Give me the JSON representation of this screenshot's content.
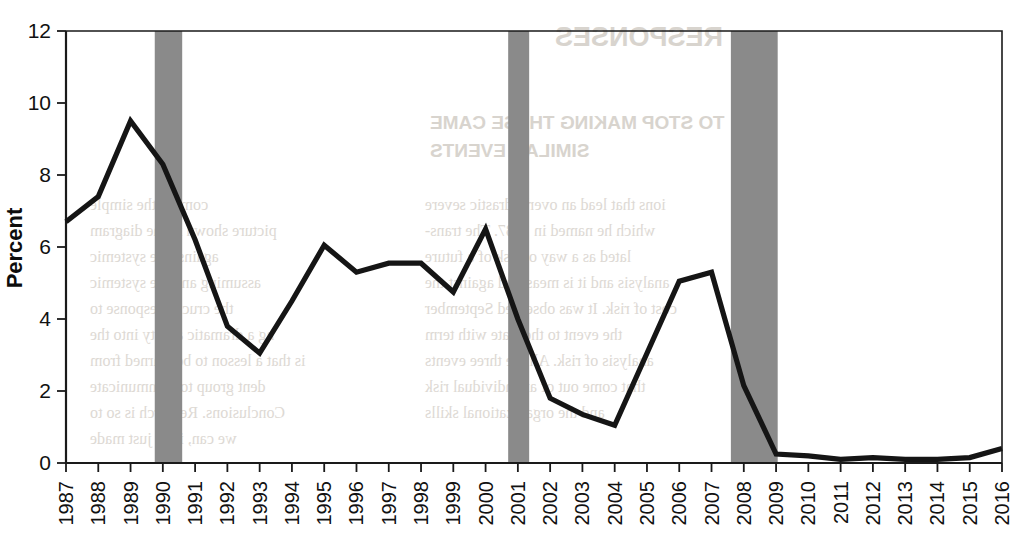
{
  "chart_data": {
    "type": "line",
    "title": "",
    "xlabel": "",
    "ylabel": "Percent",
    "ylim": [
      0,
      12
    ],
    "yticks": [
      0,
      2,
      4,
      6,
      8,
      10,
      12
    ],
    "xlim": [
      1987,
      2016
    ],
    "grid": false,
    "legend": "none",
    "x": [
      1987,
      1988,
      1989,
      1990,
      1991,
      1992,
      1993,
      1994,
      1995,
      1996,
      1997,
      1998,
      1999,
      2000,
      2001,
      2002,
      2003,
      2004,
      2005,
      2006,
      2007,
      2008,
      2009,
      2010,
      2011,
      2012,
      2013,
      2014,
      2015,
      2016
    ],
    "categories": [
      "1987",
      "1988",
      "1989",
      "1990",
      "1991",
      "1992",
      "1993",
      "1994",
      "1995",
      "1996",
      "1997",
      "1998",
      "1999",
      "2000",
      "2001",
      "2002",
      "2003",
      "2004",
      "2005",
      "2006",
      "2007",
      "2008",
      "2009",
      "2010",
      "2011",
      "2012",
      "2013",
      "2014",
      "2015",
      "2016"
    ],
    "series": [
      {
        "name": "Percent",
        "values": [
          6.7,
          7.4,
          9.5,
          8.3,
          6.2,
          3.8,
          3.05,
          4.5,
          6.05,
          5.3,
          5.55,
          5.55,
          4.75,
          6.5,
          4.0,
          1.8,
          1.35,
          1.05,
          3.05,
          5.05,
          5.3,
          2.15,
          0.25,
          0.2,
          0.1,
          0.15,
          0.1,
          0.1,
          0.15,
          0.4
        ]
      }
    ],
    "shaded_regions": [
      {
        "label": "recession-band-1990",
        "start": 1989.75,
        "end": 1990.6
      },
      {
        "label": "recession-band-2001",
        "start": 2000.7,
        "end": 2001.35
      },
      {
        "label": "recession-band-2008",
        "start": 2007.6,
        "end": 2009.05
      }
    ],
    "colors": {
      "line": "#151515",
      "shaded_region": "#8a8a8a",
      "axis": "#1a1a1a",
      "background": "#ffffff"
    }
  },
  "axes": {
    "y_title": "Percent",
    "y_tick_labels": [
      "0",
      "2",
      "4",
      "6",
      "8",
      "10",
      "12"
    ],
    "x_tick_labels": [
      "1987",
      "1988",
      "1989",
      "1990",
      "1991",
      "1992",
      "1993",
      "1994",
      "1995",
      "1996",
      "1997",
      "1998",
      "1999",
      "2000",
      "2001",
      "2002",
      "2003",
      "2004",
      "2005",
      "2006",
      "2007",
      "2008",
      "2009",
      "2010",
      "2011",
      "2012",
      "2013",
      "2014",
      "2015",
      "2016"
    ]
  },
  "page_ghost_text": {
    "heading_right": "RESPONSES",
    "subheading_right_1": "TO STOP MAKING THESE CAME",
    "subheading_right_2": "SIMILAR EVENTS",
    "col_right": [
      "ions that lead an overly drastic severe",
      "which he named in 1987. The trans-",
      "lated as a way of risk of a future",
      "analysis and it is measured against the",
      "cost of risk. It was observed September",
      "the event to the state with term",
      "analysis of risk. All the three events",
      "that come out of an individual risk",
      "and the organizational skills"
    ],
    "col_left": [
      "coming the simple",
      "picture shown in the diagram",
      "against the systemic",
      "assuming and the systemic",
      "the crucial response to",
      "ng a dramatic ability into the",
      "is that a lesson to be learned from",
      "dent group to communicate",
      "Conclusions. Research is so to",
      "we can, it be just made",
      "more to stop. 1 see system"
    ]
  }
}
